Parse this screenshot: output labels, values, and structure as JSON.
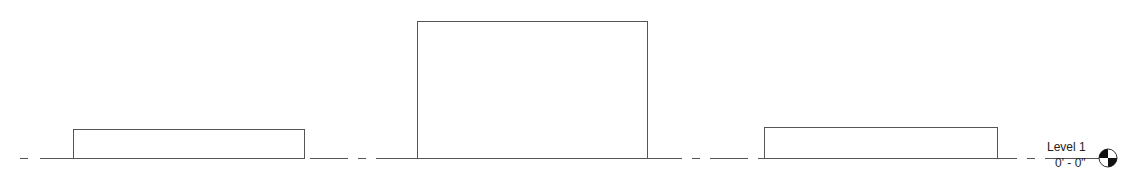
{
  "view": {
    "type": "elevation",
    "line_color": "#555555"
  },
  "level": {
    "name": "Level 1",
    "elevation": "0' - 0\"",
    "marker_icon": "level-head-icon"
  },
  "elements": [
    {
      "name": "mass-1",
      "x": 73,
      "y": 129,
      "w": 231,
      "h": 29
    },
    {
      "name": "mass-2",
      "x": 417,
      "y": 21,
      "w": 230,
      "h": 137
    },
    {
      "name": "mass-3",
      "x": 764,
      "y": 127,
      "w": 233,
      "h": 31
    }
  ]
}
